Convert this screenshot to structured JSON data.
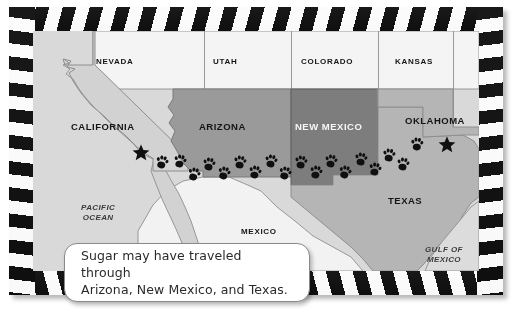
{
  "figure": {
    "kind": "illustrated-map",
    "frame_style": "film-clapper-stripes"
  },
  "map": {
    "states": [
      {
        "id": "nevada",
        "label": "NEVADA",
        "fill": "#f0f0f0",
        "shaded": false
      },
      {
        "id": "utah",
        "label": "UTAH",
        "fill": "#f0f0f0",
        "shaded": false
      },
      {
        "id": "colorado",
        "label": "COLORADO",
        "fill": "#f0f0f0",
        "shaded": false
      },
      {
        "id": "kansas",
        "label": "KANSAS",
        "fill": "#f0f0f0",
        "shaded": false
      },
      {
        "id": "california",
        "label": "CALIFORNIA",
        "fill": "#d2d2d2",
        "shaded": true
      },
      {
        "id": "arizona",
        "label": "ARIZONA",
        "fill": "#9a9a9a",
        "shaded": true
      },
      {
        "id": "new-mexico",
        "label": "NEW MEXICO",
        "fill": "#7d7d7d",
        "shaded": true
      },
      {
        "id": "oklahoma",
        "label": "OKLAHOMA",
        "fill": "#b5b5b5",
        "shaded": true
      },
      {
        "id": "texas",
        "label": "TEXAS",
        "fill": "#b5b5b5",
        "shaded": true
      }
    ],
    "regions": [
      {
        "id": "pacific-ocean",
        "label_lines": [
          "PACIFIC",
          "OCEAN"
        ],
        "style": "italic"
      },
      {
        "id": "gulf-of-mexico",
        "label_lines": [
          "GULF OF",
          "MEXICO"
        ],
        "style": "italic"
      },
      {
        "id": "mexico",
        "label_lines": [
          "MEXICO"
        ],
        "style": "upright"
      }
    ],
    "markers": {
      "stars": [
        {
          "id": "star-california",
          "near": "CALIFORNIA"
        },
        {
          "id": "star-oklahoma",
          "near": "OKLAHOMA"
        }
      ],
      "trail": {
        "id": "paw-print-trail",
        "symbol": "paw-print",
        "count": 18,
        "from": "CALIFORNIA",
        "to": "OKLAHOMA",
        "passes_through": [
          "ARIZONA",
          "NEW MEXICO",
          "TEXAS"
        ]
      }
    }
  },
  "caption": {
    "line1": "Sugar may have traveled through",
    "line2": "Arizona, New Mexico, and Texas."
  }
}
